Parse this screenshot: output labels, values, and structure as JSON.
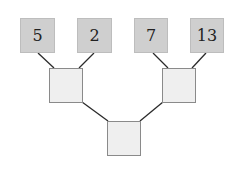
{
  "diagram": {
    "type": "binary-tree",
    "leaves": [
      "5",
      "2",
      "7",
      "13"
    ],
    "internal_nodes": [
      "",
      "",
      ""
    ]
  }
}
